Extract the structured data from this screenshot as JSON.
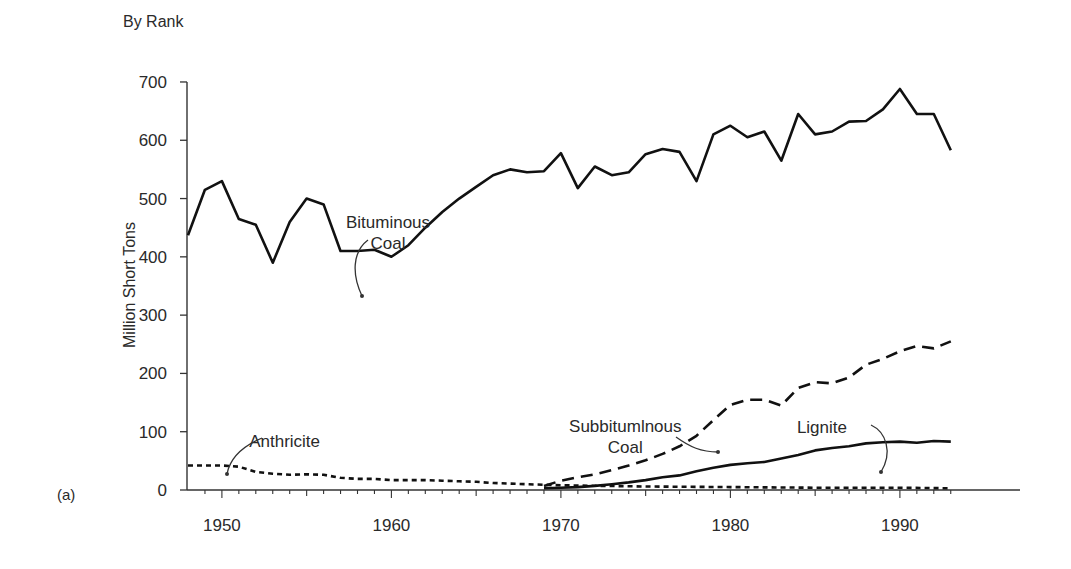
{
  "chart_data": {
    "type": "line",
    "title": "By Rank",
    "panel_label": "(a)",
    "xlabel": "",
    "ylabel": "Million Short Tons",
    "xlim": [
      1948,
      1993
    ],
    "ylim": [
      0,
      700
    ],
    "x_ticks": [
      1950,
      1960,
      1970,
      1980,
      1990
    ],
    "y_ticks": [
      0,
      100,
      200,
      300,
      400,
      500,
      600,
      700
    ],
    "grid": false,
    "legend": "inline annotations with arrows",
    "series": [
      {
        "name": "Bituminous Coal",
        "style": "solid",
        "x": [
          1948,
          1949,
          1950,
          1951,
          1952,
          1953,
          1954,
          1955,
          1956,
          1957,
          1958,
          1959,
          1960,
          1961,
          1962,
          1963,
          1964,
          1965,
          1966,
          1967,
          1968,
          1969,
          1970,
          1971,
          1972,
          1973,
          1974,
          1975,
          1976,
          1977,
          1978,
          1979,
          1980,
          1981,
          1982,
          1983,
          1984,
          1985,
          1986,
          1987,
          1988,
          1989,
          1990,
          1991,
          1992,
          1993
        ],
        "values": [
          437,
          515,
          530,
          465,
          455,
          390,
          460,
          500,
          490,
          410,
          410,
          412,
          400,
          420,
          450,
          477,
          500,
          520,
          540,
          550,
          545,
          547,
          578,
          518,
          555,
          540,
          545,
          576,
          585,
          580,
          530,
          610,
          625,
          605,
          615,
          565,
          645,
          610,
          615,
          632,
          633,
          653,
          688,
          645,
          645,
          583
        ]
      },
      {
        "name": "Subbituminous Coal",
        "style": "dashed",
        "x": [
          1969,
          1970,
          1971,
          1972,
          1973,
          1974,
          1975,
          1976,
          1977,
          1978,
          1979,
          1980,
          1981,
          1982,
          1983,
          1984,
          1985,
          1986,
          1987,
          1988,
          1989,
          1990,
          1991,
          1992,
          1993
        ],
        "values": [
          7,
          16,
          22,
          27,
          34,
          42,
          51,
          62,
          75,
          93,
          120,
          146,
          155,
          155,
          145,
          175,
          185,
          183,
          193,
          215,
          225,
          238,
          247,
          243,
          255
        ]
      },
      {
        "name": "Lignite",
        "style": "solid",
        "x": [
          1969,
          1970,
          1971,
          1972,
          1973,
          1974,
          1975,
          1976,
          1977,
          1978,
          1979,
          1980,
          1981,
          1982,
          1983,
          1984,
          1985,
          1986,
          1987,
          1988,
          1989,
          1990,
          1991,
          1992,
          1993
        ],
        "values": [
          3,
          4,
          5,
          7,
          10,
          13,
          17,
          22,
          25,
          32,
          38,
          43,
          46,
          48,
          54,
          60,
          68,
          72,
          75,
          80,
          82,
          83,
          81,
          84,
          83
        ]
      },
      {
        "name": "Anthricite",
        "style": "dotted",
        "x": [
          1948,
          1949,
          1950,
          1951,
          1952,
          1953,
          1954,
          1955,
          1956,
          1957,
          1958,
          1959,
          1960,
          1961,
          1962,
          1963,
          1964,
          1965,
          1966,
          1967,
          1968,
          1969,
          1970,
          1975,
          1980,
          1985,
          1990,
          1993
        ],
        "values": [
          42,
          42,
          42,
          40,
          31,
          28,
          26,
          27,
          26,
          21,
          19,
          19,
          17,
          17,
          17,
          16,
          15,
          14,
          12,
          11,
          10,
          9,
          8,
          6,
          5,
          4,
          4,
          3
        ]
      }
    ],
    "annotations": [
      {
        "text": [
          "Bituminous",
          "Coal"
        ],
        "x": 1959.8,
        "y": 450
      },
      {
        "text": [
          "Subbitumlnous",
          "Coal"
        ],
        "x": 1973.8,
        "y": 100
      },
      {
        "text": [
          "Lignite"
        ],
        "x": 1985.4,
        "y": 98
      },
      {
        "text": [
          "Anthricite"
        ],
        "x": 1953.7,
        "y": 73
      }
    ]
  }
}
